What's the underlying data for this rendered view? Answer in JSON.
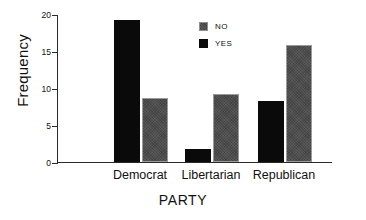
{
  "chart_data": {
    "type": "bar",
    "title": "",
    "xlabel": "PARTY",
    "ylabel": "Frequency",
    "categories": [
      "Democrat",
      "Libertarian",
      "Republican"
    ],
    "series": [
      {
        "name": "YES",
        "color": "#0a0a0a",
        "values": [
          19.2,
          1.8,
          8.2
        ]
      },
      {
        "name": "NO",
        "color": "#4a4a4a",
        "values": [
          8.7,
          9.2,
          15.8
        ]
      }
    ],
    "ylim": [
      0,
      20
    ],
    "yticks": [
      0,
      5,
      10,
      15,
      20
    ],
    "ytick_labels": [
      "0",
      "5",
      "10",
      "15",
      "20"
    ],
    "grid": false,
    "legend_position": "top-center",
    "legend_entries": [
      {
        "label": "NO",
        "swatch": "gray-swatch"
      },
      {
        "label": "YES",
        "swatch": "black-swatch"
      }
    ]
  }
}
